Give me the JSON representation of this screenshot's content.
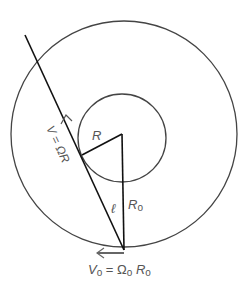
{
  "diagram": {
    "outer_circle": {
      "cx": 124,
      "cy": 134,
      "r": 113,
      "stroke": "#444444"
    },
    "inner_circle": {
      "cx": 122,
      "cy": 138,
      "r": 44,
      "stroke": "#444444"
    },
    "labels": {
      "inner_radius": "R",
      "outer_radius": "R",
      "outer_radius_sub": "o",
      "length": "ℓ",
      "velocity_tangent": "V = ΩR",
      "velocity_outer_V": "V",
      "velocity_outer_V_sub": "o",
      "velocity_outer_eq": " = Ω",
      "velocity_outer_Omega_sub": "o",
      "velocity_outer_R": " R",
      "velocity_outer_R_sub": "o"
    },
    "colors": {
      "line": "#111111",
      "arrow": "#666666",
      "text": "#555555"
    }
  }
}
